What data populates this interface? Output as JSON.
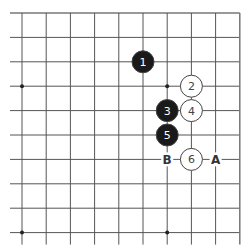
{
  "diagram": {
    "type": "go-board-fragment",
    "corner": "top-right",
    "grid": {
      "columns": 10,
      "rows": 10,
      "origin_x": 22,
      "origin_y": 13,
      "spacing_x": 24.2,
      "spacing_y": 24.4,
      "extend_left": 12,
      "extend_bottom": 12,
      "line_color": "#555555",
      "edge_color": "#777777"
    },
    "hoshi": [
      {
        "col": 0,
        "row": 3
      },
      {
        "col": 6,
        "row": 3
      },
      {
        "col": 0,
        "row": 9
      },
      {
        "col": 6,
        "row": 9
      }
    ],
    "stones": [
      {
        "move": "1",
        "color": "black",
        "col": 5,
        "row": 2
      },
      {
        "move": "2",
        "color": "white",
        "col": 7,
        "row": 3
      },
      {
        "move": "3",
        "color": "black",
        "col": 6,
        "row": 4
      },
      {
        "move": "4",
        "color": "white",
        "col": 7,
        "row": 4
      },
      {
        "move": "5",
        "color": "black",
        "col": 6,
        "row": 5
      },
      {
        "move": "6",
        "color": "white",
        "col": 7,
        "row": 6
      }
    ],
    "marks": [
      {
        "label": "B",
        "col": 6,
        "row": 6
      },
      {
        "label": "A",
        "col": 8,
        "row": 6
      }
    ],
    "colors": {
      "black_stone": "#1a1a1a",
      "white_stone": "#ffffff",
      "stone_outline": "#444444",
      "black_text": "#ffffff",
      "white_text": "#444444",
      "mark_text": "#333333"
    }
  }
}
